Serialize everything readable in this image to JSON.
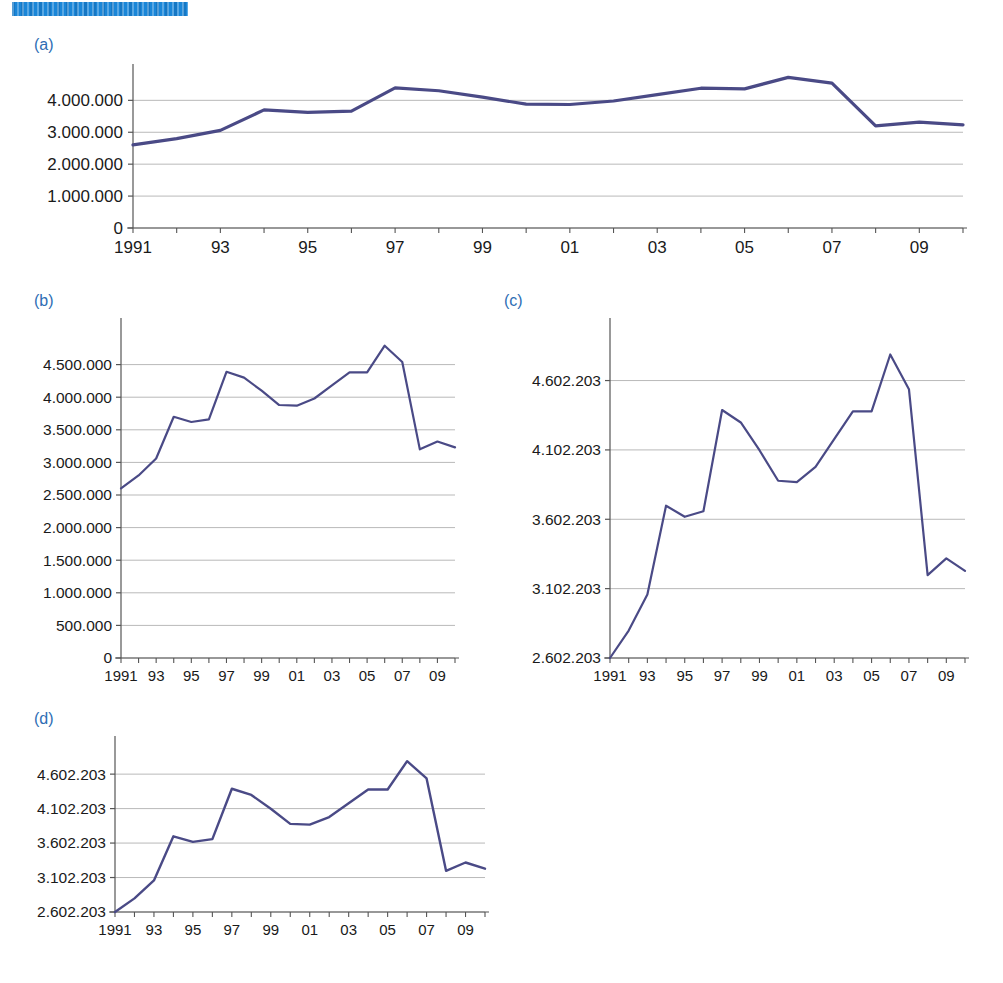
{
  "header": {
    "redacted_banner": "",
    "banner_color": "#1a86d8"
  },
  "style": {
    "line_color": "#4a4a86",
    "grid_color": "#b9b9b9",
    "axis_color": "#555555",
    "label_color": "#2e6db4"
  },
  "panels": [
    {
      "id": "a",
      "label": "(a)"
    },
    {
      "id": "b",
      "label": "(b)"
    },
    {
      "id": "c",
      "label": "(c)"
    },
    {
      "id": "d",
      "label": "(d)"
    }
  ],
  "chart_data": [
    {
      "panel": "a",
      "type": "line",
      "title": "",
      "xlabel": "",
      "ylabel": "",
      "grid": true,
      "legend": null,
      "x": [
        1991,
        1992,
        1993,
        1994,
        1995,
        1996,
        1997,
        1998,
        1999,
        2000,
        2001,
        2002,
        2003,
        2004,
        2005,
        2006,
        2007,
        2008,
        2009,
        2010
      ],
      "xtick_labels": [
        "1991",
        "",
        "93",
        "",
        "95",
        "",
        "97",
        "",
        "99",
        "",
        "01",
        "",
        "03",
        "",
        "05",
        "",
        "07",
        "",
        "09",
        ""
      ],
      "ytick_labels": [
        "0",
        "1.000.000",
        "2.000.000",
        "3.000.000",
        "4.000.000"
      ],
      "ytick_values": [
        0,
        1000000,
        2000000,
        3000000,
        4000000
      ],
      "ylim": [
        0,
        4700000
      ],
      "xlim": [
        1991,
        2010
      ],
      "values": [
        2602203,
        2800000,
        3060000,
        3700000,
        3620000,
        3660000,
        4390000,
        4300000,
        4100000,
        3880000,
        3870000,
        3980000,
        4180000,
        4380000,
        4360000,
        4720000,
        4540000,
        3200000,
        3320000,
        3230000
      ],
      "series_name": ""
    },
    {
      "panel": "b",
      "type": "line",
      "title": "",
      "xlabel": "",
      "ylabel": "",
      "grid": true,
      "legend": null,
      "x": [
        1991,
        1992,
        1993,
        1994,
        1995,
        1996,
        1997,
        1998,
        1999,
        2000,
        2001,
        2002,
        2003,
        2004,
        2005,
        2006,
        2007,
        2008,
        2009,
        2010
      ],
      "xtick_labels": [
        "1991",
        "",
        "93",
        "",
        "95",
        "",
        "97",
        "",
        "99",
        "",
        "01",
        "",
        "03",
        "",
        "05",
        "",
        "07",
        "",
        "09",
        ""
      ],
      "ytick_labels": [
        "0",
        "500.000",
        "1.000.000",
        "1.500.000",
        "2.000.000",
        "2.500.000",
        "3.000.000",
        "3.500.000",
        "4.000.000",
        "4.500.000"
      ],
      "ytick_values": [
        0,
        500000,
        1000000,
        1500000,
        2000000,
        2500000,
        3000000,
        3500000,
        4000000,
        4500000
      ],
      "ylim": [
        0,
        5000000
      ],
      "xlim": [
        1991,
        2010
      ],
      "values": [
        2602203,
        2800000,
        3060000,
        3700000,
        3620000,
        3660000,
        4390000,
        4300000,
        4100000,
        3880000,
        3870000,
        3980000,
        4180000,
        4380000,
        4380000,
        4790000,
        4540000,
        3200000,
        3320000,
        3230000
      ],
      "series_name": ""
    },
    {
      "panel": "c",
      "type": "line",
      "title": "",
      "xlabel": "",
      "ylabel": "",
      "grid": true,
      "legend": null,
      "x": [
        1991,
        1992,
        1993,
        1994,
        1995,
        1996,
        1997,
        1998,
        1999,
        2000,
        2001,
        2002,
        2003,
        2004,
        2005,
        2006,
        2007,
        2008,
        2009,
        2010
      ],
      "xtick_labels": [
        "1991",
        "",
        "93",
        "",
        "95",
        "",
        "97",
        "",
        "99",
        "",
        "01",
        "",
        "03",
        "",
        "05",
        "",
        "07",
        "",
        "09",
        ""
      ],
      "ytick_labels": [
        "2.602.203",
        "3.102.203",
        "3.602.203",
        "4.102.203",
        "4.602.203"
      ],
      "ytick_values": [
        2602203,
        3102203,
        3602203,
        4102203,
        4602203
      ],
      "ylim": [
        2602203,
        4952203
      ],
      "xlim": [
        1991,
        2010
      ],
      "values": [
        2602203,
        2800000,
        3060000,
        3700000,
        3620000,
        3660000,
        4390000,
        4300000,
        4100000,
        3880000,
        3870000,
        3980000,
        4180000,
        4380000,
        4380000,
        4790000,
        4540000,
        3200000,
        3320000,
        3230000
      ],
      "series_name": ""
    },
    {
      "panel": "d",
      "type": "line",
      "title": "",
      "xlabel": "",
      "ylabel": "",
      "grid": true,
      "legend": null,
      "x": [
        1991,
        1992,
        1993,
        1994,
        1995,
        1996,
        1997,
        1998,
        1999,
        2000,
        2001,
        2002,
        2003,
        2004,
        2005,
        2006,
        2007,
        2008,
        2009,
        2010
      ],
      "xtick_labels": [
        "1991",
        "",
        "93",
        "",
        "95",
        "",
        "97",
        "",
        "99",
        "",
        "01",
        "",
        "03",
        "",
        "05",
        "",
        "07",
        "",
        "09",
        ""
      ],
      "ytick_labels": [
        "2.602.203",
        "3.102.203",
        "3.602.203",
        "4.102.203",
        "4.602.203"
      ],
      "ytick_values": [
        2602203,
        3102203,
        3602203,
        4102203,
        4602203
      ],
      "ylim": [
        2602203,
        4952203
      ],
      "xlim": [
        1991,
        2010
      ],
      "values": [
        2602203,
        2800000,
        3060000,
        3700000,
        3620000,
        3660000,
        4390000,
        4300000,
        4100000,
        3880000,
        3870000,
        3980000,
        4180000,
        4380000,
        4380000,
        4790000,
        4540000,
        3200000,
        3320000,
        3230000
      ],
      "series_name": ""
    }
  ]
}
